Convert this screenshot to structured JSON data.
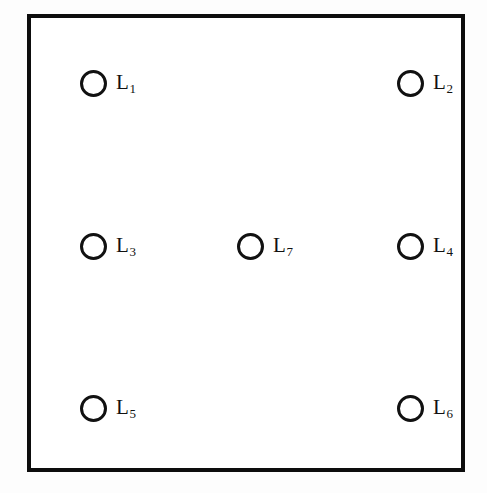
{
  "figure": {
    "type": "node-layout-diagram",
    "background_color": "#fdfdfd",
    "frame": {
      "border_color": "#0d0d0d",
      "fill_color": "#ffffff",
      "border_width_px": 4,
      "x": 27,
      "y": 14,
      "width": 438,
      "height": 458
    },
    "node_style": {
      "shape": "circle",
      "stroke_color": "#111111",
      "fill_color": "#ffffff",
      "diameter_px": 27,
      "stroke_width_px": 3
    },
    "nodes": [
      {
        "id": "L1",
        "base": "L",
        "subscript": "1",
        "row": "top",
        "column": "left",
        "cx": 90,
        "cy": 80
      },
      {
        "id": "L2",
        "base": "L",
        "subscript": "2",
        "row": "top",
        "column": "right",
        "cx": 407,
        "cy": 80
      },
      {
        "id": "L3",
        "base": "L",
        "subscript": "3",
        "row": "middle",
        "column": "left",
        "cx": 90,
        "cy": 243
      },
      {
        "id": "L7",
        "base": "L",
        "subscript": "7",
        "row": "middle",
        "column": "center",
        "cx": 247,
        "cy": 243
      },
      {
        "id": "L4",
        "base": "L",
        "subscript": "4",
        "row": "middle",
        "column": "right",
        "cx": 407,
        "cy": 243
      },
      {
        "id": "L5",
        "base": "L",
        "subscript": "5",
        "row": "bottom",
        "column": "left",
        "cx": 90,
        "cy": 405
      },
      {
        "id": "L6",
        "base": "L",
        "subscript": "6",
        "row": "bottom",
        "column": "right",
        "cx": 407,
        "cy": 405
      }
    ]
  }
}
